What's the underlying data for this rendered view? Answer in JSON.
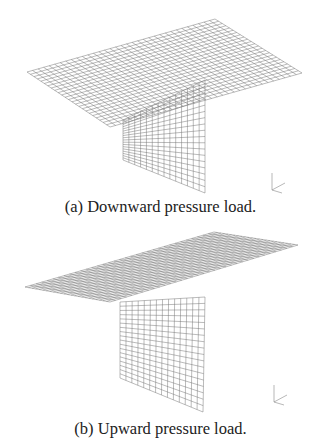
{
  "figures": [
    {
      "caption": "(a) Downward pressure load.",
      "plate": [
        [
          27,
          72
        ],
        [
          215,
          19
        ],
        [
          302,
          73
        ],
        [
          110,
          127
        ]
      ],
      "web": [
        [
          123,
          120
        ],
        [
          205,
          80
        ],
        [
          205,
          193
        ],
        [
          123,
          160
        ]
      ],
      "axes_origin": [
        272,
        190
      ]
    },
    {
      "caption": "(b) Upward pressure load.",
      "plate": [
        [
          25,
          287
        ],
        [
          214,
          232
        ],
        [
          298,
          245
        ],
        [
          110,
          302
        ]
      ],
      "web": [
        [
          120,
          302
        ],
        [
          205,
          297
        ],
        [
          203,
          412
        ],
        [
          120,
          378
        ]
      ],
      "axes_origin": [
        274,
        402
      ]
    }
  ],
  "mesh": {
    "divisions_u": 34,
    "divisions_v": 24,
    "web_u": 14,
    "web_v": 18,
    "color": "#777777"
  }
}
